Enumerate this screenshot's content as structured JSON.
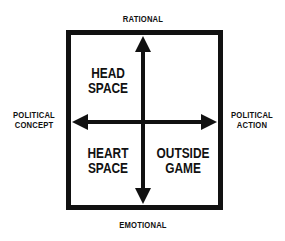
{
  "axes": {
    "top": "RATIONAL",
    "bottom": "EMOTIONAL",
    "left": [
      "POLITICAL",
      "CONCEPT"
    ],
    "right": [
      "POLITICAL",
      "ACTION"
    ]
  },
  "quadrants": {
    "top_left": [
      "HEAD",
      "SPACE"
    ],
    "top_right": [
      "",
      ""
    ],
    "bottom_left": [
      "HEART",
      "SPACE"
    ],
    "bottom_right": [
      "OUTSIDE",
      "GAME"
    ]
  },
  "colors": {
    "ink": "#111111",
    "background": "#ffffff"
  }
}
